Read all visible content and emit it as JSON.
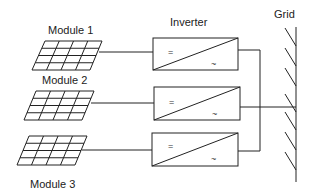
{
  "diagram": {
    "type": "pv-system-string-inverters",
    "modules": [
      {
        "label": "Module 1"
      },
      {
        "label": "Module 2"
      },
      {
        "label": "Module 3"
      }
    ],
    "inverter_title": "Inverter",
    "inverters": [
      {
        "dc_symbol": "=",
        "ac_symbol": "~"
      },
      {
        "dc_symbol": "=",
        "ac_symbol": "~"
      },
      {
        "dc_symbol": "=",
        "ac_symbol": "~"
      }
    ],
    "grid_label": "Grid",
    "colors": {
      "stroke": "#222222",
      "background": "#ffffff"
    }
  }
}
